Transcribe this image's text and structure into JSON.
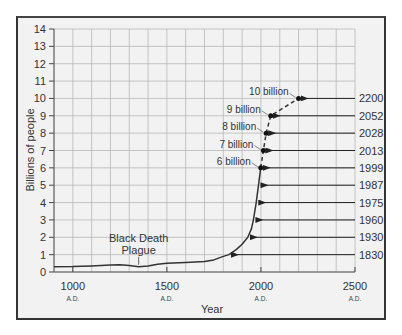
{
  "chart_data": {
    "type": "line",
    "title": "",
    "xlabel": "Year",
    "ylabel": "Billions of people",
    "xlim": [
      900,
      2500
    ],
    "ylim": [
      0,
      14
    ],
    "grid": true,
    "x_ticks": [
      {
        "value": 1000,
        "label": "1000",
        "sublabel": "A.D."
      },
      {
        "value": 1500,
        "label": "1500",
        "sublabel": "A.D."
      },
      {
        "value": 2000,
        "label": "2000",
        "sublabel": "A.D."
      },
      {
        "value": 2500,
        "label": "2500",
        "sublabel": "A.D."
      }
    ],
    "y_ticks": [
      0,
      1,
      2,
      3,
      4,
      5,
      6,
      7,
      8,
      9,
      10,
      11,
      12,
      13,
      14
    ],
    "series": [
      {
        "name": "World population (historical)",
        "style": "solid",
        "x": [
          900,
          1000,
          1100,
          1200,
          1250,
          1300,
          1350,
          1400,
          1450,
          1500,
          1600,
          1700,
          1750,
          1800,
          1830,
          1870,
          1900,
          1930,
          1950,
          1960,
          1975,
          1987,
          1999
        ],
        "y": [
          0.3,
          0.31,
          0.35,
          0.4,
          0.42,
          0.38,
          0.3,
          0.35,
          0.45,
          0.5,
          0.55,
          0.6,
          0.7,
          0.9,
          1,
          1.3,
          1.6,
          2,
          2.5,
          3,
          4,
          5,
          6
        ]
      },
      {
        "name": "World population (projected)",
        "style": "dashed",
        "x": [
          1999,
          2013,
          2028,
          2052,
          2200
        ],
        "y": [
          6,
          7,
          8,
          9,
          10
        ]
      }
    ],
    "milestones": [
      {
        "year": "1830",
        "billions": 1
      },
      {
        "year": "1930",
        "billions": 2
      },
      {
        "year": "1960",
        "billions": 3
      },
      {
        "year": "1975",
        "billions": 4
      },
      {
        "year": "1987",
        "billions": 5
      },
      {
        "year": "1999",
        "billions": 6,
        "label": "6 billion"
      },
      {
        "year": "2013",
        "billions": 7,
        "label": "7 billion"
      },
      {
        "year": "2028",
        "billions": 8,
        "label": "8 billion"
      },
      {
        "year": "2052",
        "billions": 9,
        "label": "9 billion"
      },
      {
        "year": "2200",
        "billions": 10,
        "label": "10 billion"
      }
    ],
    "annotations": [
      {
        "text": "Black Death",
        "x": 1350,
        "y": 1.7
      },
      {
        "text": "Plague",
        "x": 1350,
        "y": 1.0
      }
    ]
  },
  "labels": {
    "ylabel": "Billions of people",
    "xlabel": "Year",
    "annotation_line1": "Black Death",
    "annotation_line2": "Plague"
  },
  "colors": {
    "line": "#333333",
    "grid": "#b8b8b8",
    "background": "#f2f2f2"
  }
}
